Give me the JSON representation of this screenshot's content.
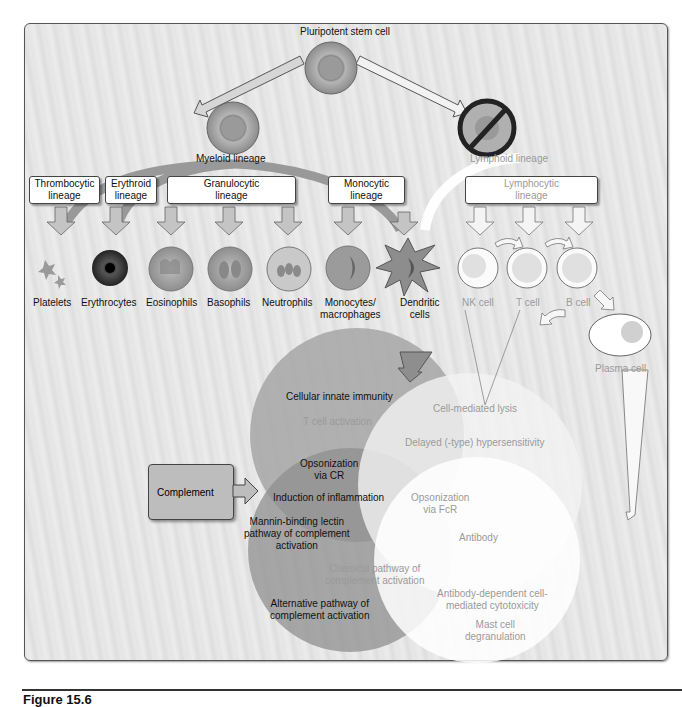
{
  "figure": {
    "caption": "Figure 15.6"
  },
  "top": {
    "stem_cell": "Pluripotent stem cell",
    "myeloid": "Myeloid lineage",
    "lymphoid": "Lymphoid lineage"
  },
  "lineage_boxes": [
    {
      "label": "Thrombocytic\nlineage"
    },
    {
      "label": "Erythroid\nlineage"
    },
    {
      "label": "Granulocytic\nlineage"
    },
    {
      "label": "Monocytic\nlineage"
    },
    {
      "label": "Lymphocytic\nlineage"
    }
  ],
  "cells": [
    {
      "label": "Platelets"
    },
    {
      "label": "Erythrocytes"
    },
    {
      "label": "Eosinophils"
    },
    {
      "label": "Basophils"
    },
    {
      "label": "Neutrophils"
    },
    {
      "label": "Monocytes/\nmacrophages"
    },
    {
      "label": "Dendritic\ncells"
    },
    {
      "label": "NK cell"
    },
    {
      "label": "T cell"
    },
    {
      "label": "B cell"
    },
    {
      "label": "Plasma cell"
    }
  ],
  "complement_box": "Complement",
  "venn": {
    "innate_circle": [
      "Cellular innate immunity",
      "T cell activation"
    ],
    "complement_circle": [
      "Opsonization\nvia CR",
      "Induction of inflammation",
      "Mannin-binding lectin\npathway of complement\nactivation",
      "Alternative pathway of\ncomplement activation"
    ],
    "cell_mediated_circle": [
      "Cell-mediated lysis",
      "Delayed (-type) hypersensitivity"
    ],
    "antibody_circle": [
      "Opsonization\nvia FcR",
      "Antibody",
      "Classical pathway of\ncomplement activation",
      "Antibody-dependent cell-\nmediated cytotoxicity",
      "Mast cell\ndegranulation"
    ]
  },
  "colors": {
    "innate_circle": "#a8a8a8",
    "complement_circle": "#939393",
    "adaptive_circle": "#f4f4f4",
    "antibody_circle": "#ffffff"
  }
}
